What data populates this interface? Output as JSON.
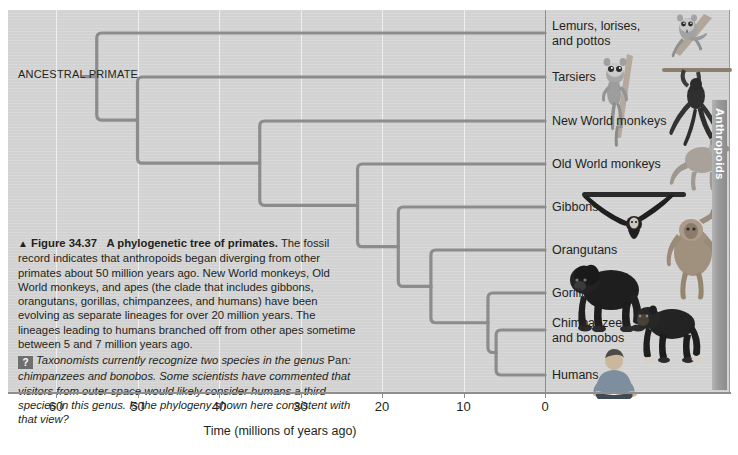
{
  "figure": {
    "number": "Figure 34.37",
    "title": "A phylogenetic tree of primates.",
    "triangle": "▲",
    "body": " The fossil record indicates that anthropoids began diverging from other primates about 50 million years ago. New World monkeys, Old World monkeys, and apes (the clade that includes gibbons, orangutans, gorillas, chimpanzees, and humans) have been evolving as separate lineages for over 20 million years. The lineages leading to humans branched off from other apes sometime between 5 and 7 million years ago.",
    "question_badge": "?",
    "question_part1": "Taxonomists currently recognize two species in the genus ",
    "question_genus": "Pan",
    "question_part2": ": chimpanzees and bonobos. Some scientists have commented that visitors from outer space would likely consider humans a third species in this genus. Is the phylogeny shown here consistent with that view?"
  },
  "axis": {
    "title": "Time (millions of years ago)",
    "ticks": [
      60,
      50,
      40,
      30,
      20,
      10,
      0
    ],
    "tick_labels": [
      "60",
      "50",
      "40",
      "30",
      "20",
      "10",
      "0"
    ],
    "range": [
      68,
      0
    ],
    "units": "millions of years ago"
  },
  "root_label": "ANCESTRAL\nPRIMATE",
  "clade_bracket": {
    "label": "Anthropoids"
  },
  "colors": {
    "panel": "#d2d2d2",
    "branch": "#8c8c8c",
    "gridline": "#efefef",
    "axis": "#8e8e8e",
    "text": "#231f20",
    "bracket": "#9a9a9a"
  },
  "chart_data": {
    "type": "tree",
    "title": "A phylogenetic tree of primates",
    "xlabel": "Time (millions of years ago)",
    "ylabel": "",
    "xlim": [
      68,
      0
    ],
    "grid": true,
    "axis_direction": "reversed",
    "tips": [
      {
        "id": "lemurs",
        "label": "Lemurs, lorises,\nand pottos",
        "y": 33,
        "time": 0,
        "icon": "lemur-silhouette"
      },
      {
        "id": "tarsiers",
        "label": "Tarsiers",
        "y": 77,
        "time": 0,
        "icon": "tarsier-silhouette"
      },
      {
        "id": "new-world",
        "label": "New World monkeys",
        "y": 121,
        "time": 0,
        "icon": "spider-monkey-silhouette"
      },
      {
        "id": "old-world",
        "label": "Old World monkeys",
        "y": 164,
        "time": 0,
        "icon": "macaque-silhouette"
      },
      {
        "id": "gibbons",
        "label": "Gibbons",
        "y": 207,
        "time": 0,
        "icon": "gibbon-silhouette"
      },
      {
        "id": "orangutans",
        "label": "Orangutans",
        "y": 250,
        "time": 0,
        "icon": "orangutan-silhouette"
      },
      {
        "id": "gorillas",
        "label": "Gorillas",
        "y": 293,
        "time": 0,
        "icon": "gorilla-silhouette"
      },
      {
        "id": "chimpanzees",
        "label": "Chimpanzees\nand bonobos",
        "y": 330,
        "time": 0,
        "icon": "chimpanzee-silhouette"
      },
      {
        "id": "humans",
        "label": "Humans",
        "y": 375,
        "time": 0,
        "icon": "human-silhouette"
      }
    ],
    "nodes": [
      {
        "id": "n-root",
        "time": 55,
        "label": "ancestral primate",
        "children": [
          "lemurs",
          "n-haplorhini"
        ]
      },
      {
        "id": "n-haplorhini",
        "time": 50,
        "label": "haplorhine split",
        "children": [
          "tarsiers",
          "n-anthropoid"
        ]
      },
      {
        "id": "n-anthropoid",
        "time": 35,
        "label": "anthropoid split",
        "children": [
          "new-world",
          "n-catarrhine"
        ]
      },
      {
        "id": "n-catarrhine",
        "time": 23,
        "label": "catarrhine split",
        "children": [
          "old-world",
          "n-apes"
        ]
      },
      {
        "id": "n-apes",
        "time": 18,
        "label": "ape split",
        "children": [
          "gibbons",
          "n-greatapes"
        ]
      },
      {
        "id": "n-greatapes",
        "time": 14,
        "label": "great ape split",
        "children": [
          "orangutans",
          "n-african"
        ]
      },
      {
        "id": "n-african",
        "time": 7,
        "label": "african ape split",
        "children": [
          "gorillas",
          "n-panhomo"
        ]
      },
      {
        "id": "n-panhomo",
        "time": 6,
        "label": "chimp-human split",
        "children": [
          "chimpanzees",
          "humans"
        ]
      }
    ],
    "notes": [
      "Anthropoids began diverging from other primates about 50 million years ago",
      "New World monkeys, Old World monkeys, and apes evolving separately for over 20 million years",
      "Human lineage branched off from other apes between 5 and 7 million years ago"
    ]
  }
}
